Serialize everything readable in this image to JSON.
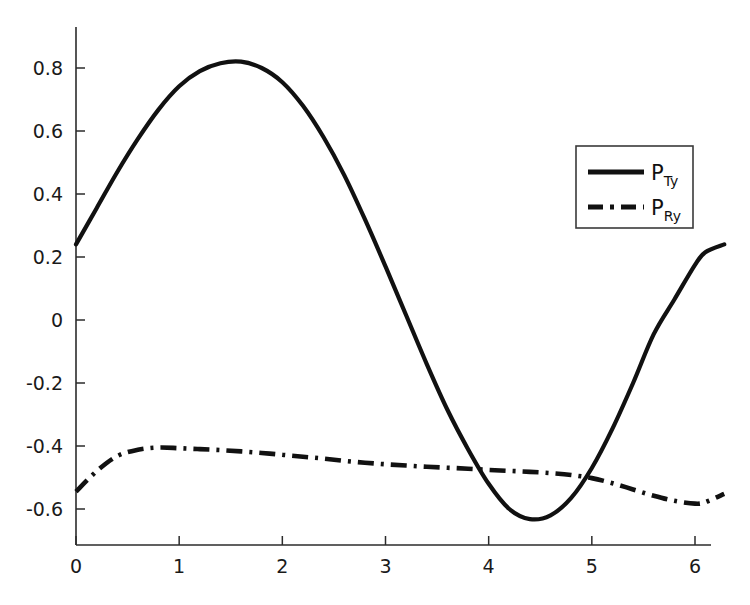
{
  "chart_data": {
    "type": "line",
    "title": "",
    "subtitle": "",
    "xlabel": "",
    "ylabel": "",
    "xlim": [
      0,
      6.283185
    ],
    "ylim": [
      -0.7,
      0.9
    ],
    "grid": false,
    "legend_position": "upper right",
    "x_ticks": [
      "0",
      "1",
      "2",
      "3",
      "4",
      "5",
      "6"
    ],
    "x_tick_values": [
      0,
      1,
      2,
      3,
      4,
      5,
      6
    ],
    "y_ticks": [
      "0.8",
      "0.6",
      "0.4",
      "0.2",
      "0",
      "-0.2",
      "-0.4",
      "-0.6"
    ],
    "y_tick_values": [
      0.8,
      0.6,
      0.4,
      0.2,
      0,
      -0.2,
      -0.4,
      -0.6
    ],
    "x": [
      0.0,
      0.2,
      0.4,
      0.6,
      0.8,
      1.0,
      1.2,
      1.4,
      1.6,
      1.8,
      2.0,
      2.2,
      2.4,
      2.6,
      2.8,
      3.0,
      3.2,
      3.4,
      3.6,
      3.8,
      4.0,
      4.2,
      4.4,
      4.6,
      4.8,
      5.0,
      5.2,
      5.4,
      5.6,
      5.8,
      6.0,
      6.1,
      6.283185
    ],
    "series": [
      {
        "name": "P_Ty",
        "label": "P",
        "sublabel": "Ty",
        "style": "solid",
        "color": "#111111",
        "values": [
          0.24,
          0.355,
          0.47,
          0.575,
          0.668,
          0.742,
          0.79,
          0.815,
          0.82,
          0.8,
          0.755,
          0.68,
          0.58,
          0.46,
          0.32,
          0.17,
          0.015,
          -0.14,
          -0.285,
          -0.41,
          -0.52,
          -0.6,
          -0.632,
          -0.62,
          -0.565,
          -0.47,
          -0.345,
          -0.2,
          -0.045,
          0.065,
          0.175,
          0.215,
          0.24
        ]
      },
      {
        "name": "P_Ry",
        "label": "P",
        "sublabel": "Ry",
        "style": "dash-dot",
        "color": "#111111",
        "values": [
          -0.545,
          -0.48,
          -0.432,
          -0.412,
          -0.405,
          -0.407,
          -0.41,
          -0.413,
          -0.417,
          -0.422,
          -0.428,
          -0.434,
          -0.44,
          -0.447,
          -0.453,
          -0.458,
          -0.462,
          -0.466,
          -0.469,
          -0.472,
          -0.476,
          -0.479,
          -0.482,
          -0.486,
          -0.492,
          -0.502,
          -0.518,
          -0.538,
          -0.558,
          -0.574,
          -0.583,
          -0.578,
          -0.552
        ]
      }
    ],
    "annotations": {
      "solid_peak": {
        "x": 1.65,
        "y": 0.82
      },
      "solid_min": {
        "x": 4.22,
        "y": -0.635
      },
      "dashdot_peak": {
        "x": 0.8,
        "y": -0.405
      },
      "dashdot_min": {
        "x": 6.02,
        "y": -0.585
      },
      "crossings": [
        {
          "x": 3.48
        },
        {
          "x": 4.66
        }
      ]
    }
  },
  "legend": {
    "entries": [
      {
        "label": "P",
        "sublabel": "Ty",
        "style": "solid"
      },
      {
        "label": "P",
        "sublabel": "Ry",
        "style": "dash-dot"
      }
    ]
  }
}
